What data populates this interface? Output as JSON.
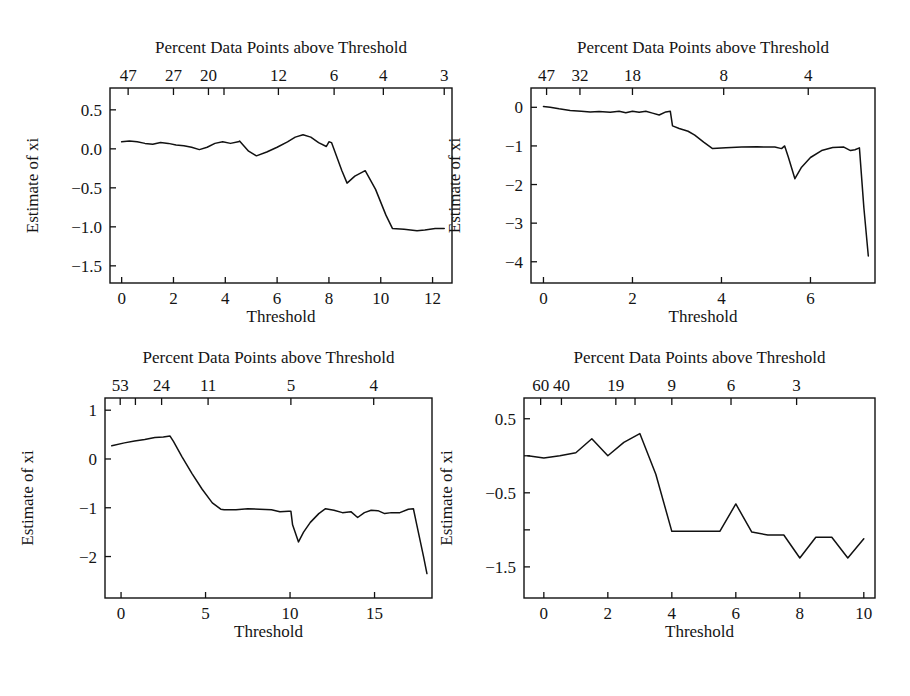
{
  "figure": {
    "panel_count": 4,
    "background_color": "#ffffff",
    "line_color": "#111111"
  },
  "chart_data": [
    {
      "id": "panel-top-left",
      "type": "line",
      "title": "Percent Data Points above Threshold",
      "xlabel": "Threshold",
      "ylabel": "Estimate of xi",
      "xlim": [
        -0.45,
        12.75
      ],
      "ylim": [
        -1.72,
        0.78
      ],
      "grid": false,
      "legend": "none",
      "xticks": [
        0,
        2,
        4,
        6,
        8,
        10,
        12
      ],
      "xticklabels": [
        "0",
        "2",
        "4",
        "6",
        "8",
        "10",
        "12"
      ],
      "yticks": [
        0.5,
        0.0,
        -0.5,
        -1.0,
        -1.5
      ],
      "yticklabels": [
        "0.5",
        "0.0",
        "-0.5",
        "-1.0",
        "-1.5"
      ],
      "top_axis_label": "Percent Data Points above Threshold",
      "top_ticks_x": [
        0.25,
        2.0,
        3.35,
        6.05,
        8.2,
        10.1,
        12.45
      ],
      "top_ticklabels": [
        "47",
        "27",
        "20",
        "12",
        "6",
        "4",
        "3"
      ],
      "top_minor_ticks_x": [
        3.95
      ],
      "x": [
        0.0,
        0.3,
        0.6,
        0.9,
        1.2,
        1.5,
        1.8,
        2.1,
        2.4,
        2.7,
        3.0,
        3.3,
        3.6,
        3.9,
        4.2,
        4.5,
        4.55,
        4.9,
        5.2,
        5.6,
        6.0,
        6.4,
        6.7,
        7.0,
        7.3,
        7.6,
        7.9,
        8.0,
        8.1,
        8.5,
        8.7,
        9.0,
        9.4,
        9.8,
        10.2,
        10.45,
        10.9,
        11.4,
        11.7,
        12.1,
        12.45
      ],
      "y": [
        0.09,
        0.1,
        0.09,
        0.07,
        0.06,
        0.08,
        0.07,
        0.05,
        0.04,
        0.02,
        -0.01,
        0.02,
        0.07,
        0.09,
        0.07,
        0.09,
        0.1,
        -0.03,
        -0.09,
        -0.04,
        0.02,
        0.09,
        0.15,
        0.18,
        0.15,
        0.08,
        0.03,
        0.09,
        0.08,
        -0.28,
        -0.44,
        -0.35,
        -0.28,
        -0.52,
        -0.85,
        -1.02,
        -1.03,
        -1.05,
        -1.04,
        -1.02,
        -1.02
      ]
    },
    {
      "id": "panel-top-right",
      "type": "line",
      "title": "Percent Data Points above Threshold",
      "xlabel": "Threshold",
      "ylabel": "Estimate of xi",
      "xlim": [
        -0.28,
        7.45
      ],
      "ylim": [
        -4.55,
        0.5
      ],
      "grid": false,
      "legend": "none",
      "xticks": [
        0,
        2,
        4,
        6
      ],
      "xticklabels": [
        "0",
        "2",
        "4",
        "6"
      ],
      "yticks": [
        0,
        -1,
        -2,
        -3,
        -4
      ],
      "yticklabels": [
        "0",
        "-1",
        "-2",
        "-3",
        "-4"
      ],
      "top_axis_label": "Percent Data Points above Threshold",
      "top_ticks_x": [
        0.07,
        0.82,
        2.0,
        4.05,
        5.95
      ],
      "top_ticklabels": [
        "47",
        "32",
        "18",
        "8",
        "4"
      ],
      "top_minor_ticks_x": [],
      "x": [
        0.0,
        0.15,
        0.35,
        0.6,
        0.85,
        1.05,
        1.25,
        1.5,
        1.7,
        1.85,
        2.0,
        2.15,
        2.3,
        2.45,
        2.6,
        2.75,
        2.85,
        2.9,
        3.05,
        3.25,
        3.4,
        3.6,
        3.8,
        4.1,
        4.45,
        4.8,
        5.0,
        5.2,
        5.35,
        5.42,
        5.5,
        5.65,
        5.8,
        6.0,
        6.25,
        6.5,
        6.75,
        6.9,
        7.0,
        7.1,
        7.2,
        7.3
      ],
      "y": [
        0.02,
        0.0,
        -0.04,
        -0.08,
        -0.1,
        -0.12,
        -0.11,
        -0.13,
        -0.1,
        -0.14,
        -0.1,
        -0.13,
        -0.1,
        -0.15,
        -0.2,
        -0.12,
        -0.1,
        -0.48,
        -0.55,
        -0.62,
        -0.72,
        -0.9,
        -1.07,
        -1.05,
        -1.03,
        -1.02,
        -1.03,
        -1.03,
        -1.07,
        -1.0,
        -1.28,
        -1.85,
        -1.55,
        -1.3,
        -1.12,
        -1.04,
        -1.03,
        -1.12,
        -1.1,
        -1.05,
        -2.6,
        -3.85
      ]
    },
    {
      "id": "panel-bottom-left",
      "type": "line",
      "title": "Percent Data Points above Threshold",
      "xlabel": "Threshold",
      "ylabel": "Estimate of xi",
      "xlim": [
        -0.95,
        18.4
      ],
      "ylim": [
        -2.85,
        1.25
      ],
      "grid": false,
      "legend": "none",
      "xticks": [
        0,
        5,
        10,
        15
      ],
      "xticklabels": [
        "0",
        "5",
        "10",
        "15"
      ],
      "yticks": [
        1,
        0,
        -1,
        -2
      ],
      "yticklabels": [
        "1",
        "0",
        "-1",
        "-2"
      ],
      "top_axis_label": "Percent Data Points above Threshold",
      "top_ticks_x": [
        -0.05,
        2.4,
        5.15,
        10.05,
        14.95
      ],
      "top_ticklabels": [
        "53",
        "24",
        "11",
        "5",
        "4"
      ],
      "top_minor_ticks_x": [
        0.85
      ],
      "x": [
        -0.55,
        0.2,
        0.8,
        1.4,
        2.0,
        2.5,
        2.9,
        3.1,
        3.6,
        4.2,
        4.8,
        5.4,
        5.9,
        6.1,
        6.8,
        7.5,
        8.2,
        8.9,
        9.4,
        9.9,
        10.05,
        10.15,
        10.5,
        10.8,
        11.2,
        11.7,
        12.1,
        12.6,
        13.1,
        13.6,
        14.0,
        14.4,
        14.8,
        15.2,
        15.6,
        16.0,
        16.5,
        17.0,
        17.3,
        17.5,
        17.9,
        18.1
      ],
      "y": [
        0.27,
        0.33,
        0.37,
        0.4,
        0.44,
        0.45,
        0.47,
        0.36,
        0.05,
        -0.3,
        -0.62,
        -0.9,
        -1.03,
        -1.04,
        -1.04,
        -1.02,
        -1.03,
        -1.04,
        -1.08,
        -1.07,
        -1.07,
        -1.35,
        -1.7,
        -1.5,
        -1.3,
        -1.12,
        -1.02,
        -1.05,
        -1.1,
        -1.08,
        -1.2,
        -1.1,
        -1.05,
        -1.06,
        -1.12,
        -1.1,
        -1.1,
        -1.03,
        -1.02,
        -1.35,
        -2.0,
        -2.35
      ]
    },
    {
      "id": "panel-bottom-right",
      "type": "line",
      "title": "Percent Data Points above Threshold",
      "xlabel": "Threshold",
      "ylabel": "Estimate of xi",
      "xlim": [
        -0.62,
        10.35
      ],
      "ylim": [
        -1.92,
        0.78
      ],
      "grid": false,
      "legend": "none",
      "xticks": [
        0,
        2,
        4,
        6,
        8,
        10
      ],
      "xticklabels": [
        "0",
        "2",
        "4",
        "6",
        "8",
        "10"
      ],
      "yticks": [
        0.5,
        -0.5,
        -1.5
      ],
      "yticklabels": [
        "0.5",
        "-0.5",
        "-1.5"
      ],
      "yminorticks": [
        0.0,
        -1.0
      ],
      "top_axis_label": "Percent Data Points above Threshold",
      "top_ticks_x": [
        -0.1,
        0.55,
        2.25,
        4.0,
        5.85,
        7.9
      ],
      "top_ticklabels": [
        "60",
        "40",
        "19",
        "9",
        "6",
        "3"
      ],
      "top_minor_ticks_x": [
        2.85
      ],
      "x": [
        -0.5,
        0.0,
        0.5,
        1.0,
        1.5,
        2.0,
        2.5,
        3.0,
        3.5,
        4.0,
        4.5,
        5.0,
        5.5,
        6.0,
        6.5,
        7.0,
        7.5,
        8.0,
        8.5,
        9.0,
        9.5,
        10.0
      ],
      "y": [
        0.0,
        -0.03,
        0.0,
        0.04,
        0.23,
        0.0,
        0.18,
        0.3,
        -0.25,
        -1.02,
        -1.02,
        -1.02,
        -1.02,
        -0.65,
        -1.03,
        -1.07,
        -1.07,
        -1.38,
        -1.1,
        -1.1,
        -1.38,
        -1.12
      ]
    }
  ]
}
